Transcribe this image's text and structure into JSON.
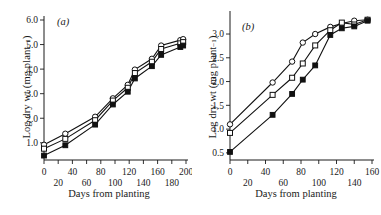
{
  "figure": {
    "background": "#ffffff",
    "ink_color": "#111111"
  },
  "panels": [
    {
      "key": "a",
      "label": "(a)",
      "xlabel": "Days from planting",
      "ylabel_main": "Log dry wt (mg plant",
      "ylabel_sup": "−1",
      "ylabel_close": ")",
      "x_ticks_upper": [
        "0",
        "40",
        "80",
        "120",
        "160",
        "200"
      ],
      "x_ticks_lower": [
        "20",
        "60",
        "100",
        "140",
        "180"
      ],
      "y_ticks": [
        "1.0",
        "2.0",
        "3.0",
        "4.0",
        "5.0",
        "6.0"
      ]
    },
    {
      "key": "b",
      "label": "(b)",
      "xlabel": "Days from planting",
      "ylabel_main": "Log dry wt (mg plant",
      "ylabel_sup": "−1",
      "ylabel_close": ")",
      "x_ticks_upper": [
        "0",
        "40",
        "80",
        "120",
        "160"
      ],
      "x_ticks_lower": [
        "20",
        "60",
        "100",
        "140"
      ],
      "y_ticks": [
        "0.5",
        "1.0",
        "1.5",
        "2.0",
        "2.5",
        "3.0"
      ]
    }
  ],
  "chart_data": [
    {
      "type": "line",
      "title": "(a)",
      "xlabel": "Days from planting",
      "ylabel": "Log dry wt (mg plant−1)",
      "xlim": [
        0,
        200
      ],
      "ylim": [
        0.3,
        6.0
      ],
      "xticks": [
        0,
        20,
        40,
        60,
        80,
        100,
        120,
        140,
        160,
        180,
        200
      ],
      "yticks": [
        1.0,
        2.0,
        3.0,
        4.0,
        5.0,
        6.0
      ],
      "grid": false,
      "legend": "none",
      "series": [
        {
          "name": "open-circle",
          "marker": "open-circle",
          "x": [
            0,
            30,
            72,
            97,
            118,
            128,
            152,
            165,
            192,
            196
          ],
          "y": [
            0.92,
            1.37,
            2.06,
            2.81,
            3.36,
            3.98,
            4.42,
            4.96,
            5.18,
            5.22
          ]
        },
        {
          "name": "open-square",
          "marker": "open-square",
          "x": [
            0,
            30,
            72,
            97,
            118,
            128,
            152,
            165,
            192,
            196
          ],
          "y": [
            0.76,
            1.16,
            1.92,
            2.72,
            3.24,
            3.84,
            4.3,
            4.82,
            5.05,
            5.1
          ]
        },
        {
          "name": "filled-square",
          "marker": "filled-square",
          "x": [
            0,
            30,
            72,
            97,
            118,
            128,
            152,
            165,
            192,
            196
          ],
          "y": [
            0.48,
            0.9,
            1.74,
            2.56,
            3.08,
            3.62,
            4.12,
            4.58,
            4.9,
            4.96
          ]
        }
      ]
    },
    {
      "type": "line",
      "title": "(b)",
      "xlabel": "Days from planting",
      "ylabel": "Log dry wt (mg plant−1)",
      "xlim": [
        0,
        160
      ],
      "ylim": [
        0.35,
        3.4
      ],
      "xticks": [
        0,
        20,
        40,
        60,
        80,
        100,
        120,
        140,
        160
      ],
      "yticks": [
        0.5,
        1.0,
        1.5,
        2.0,
        2.5,
        3.0
      ],
      "grid": false,
      "legend": "none",
      "series": [
        {
          "name": "open-circle",
          "marker": "open-circle",
          "x": [
            0,
            48,
            70,
            82,
            96,
            113,
            126,
            140,
            155
          ],
          "y": [
            1.1,
            1.98,
            2.42,
            2.82,
            3.0,
            3.15,
            3.22,
            3.28,
            3.3
          ]
        },
        {
          "name": "open-square",
          "marker": "open-square",
          "x": [
            0,
            48,
            70,
            82,
            96,
            113,
            126,
            140,
            155
          ],
          "y": [
            0.92,
            1.72,
            2.08,
            2.38,
            2.76,
            3.08,
            3.24,
            3.2,
            3.3
          ]
        },
        {
          "name": "filled-square",
          "marker": "filled-square",
          "x": [
            0,
            48,
            70,
            82,
            96,
            113,
            126,
            140,
            155
          ],
          "y": [
            0.52,
            1.3,
            1.74,
            2.04,
            2.34,
            2.98,
            3.12,
            3.16,
            3.28
          ]
        }
      ]
    }
  ]
}
